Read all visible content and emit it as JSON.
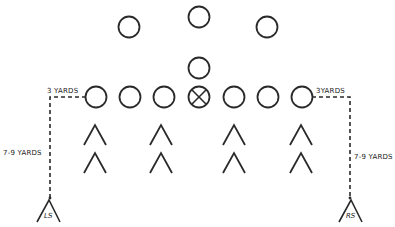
{
  "diagram": {
    "type": "football formation",
    "colors": {
      "ink": "#2a2a2a",
      "background": "#ffffff"
    },
    "offense": {
      "backs": [
        {
          "cx": 129,
          "cy": 27
        },
        {
          "cx": 199,
          "cy": 17
        },
        {
          "cx": 267,
          "cy": 27
        },
        {
          "cx": 199,
          "cy": 68
        }
      ],
      "line": [
        {
          "cx": 96,
          "cy": 97,
          "center": false
        },
        {
          "cx": 130,
          "cy": 97,
          "center": false
        },
        {
          "cx": 164,
          "cy": 97,
          "center": false
        },
        {
          "cx": 199,
          "cy": 97,
          "center": true
        },
        {
          "cx": 234,
          "cy": 97,
          "center": false
        },
        {
          "cx": 268,
          "cy": 97,
          "center": false
        },
        {
          "cx": 302,
          "cy": 97,
          "center": false
        }
      ]
    },
    "defense": {
      "chevrons": [
        {
          "x": 95,
          "y": 125
        },
        {
          "x": 161,
          "y": 125
        },
        {
          "x": 234,
          "y": 125
        },
        {
          "x": 301,
          "y": 125
        },
        {
          "x": 95,
          "y": 153
        },
        {
          "x": 161,
          "y": 153
        },
        {
          "x": 234,
          "y": 153
        },
        {
          "x": 301,
          "y": 153
        }
      ],
      "safeties": [
        {
          "label": "LS",
          "x": 48,
          "y": 200
        },
        {
          "label": "RS",
          "x": 350,
          "y": 200
        }
      ]
    },
    "labels": {
      "left_horizontal": "3 YARDS",
      "left_vertical": "7-9 YARDS",
      "right_horizontal": "3YARDS",
      "right_vertical": "7-9 YARDS"
    }
  }
}
